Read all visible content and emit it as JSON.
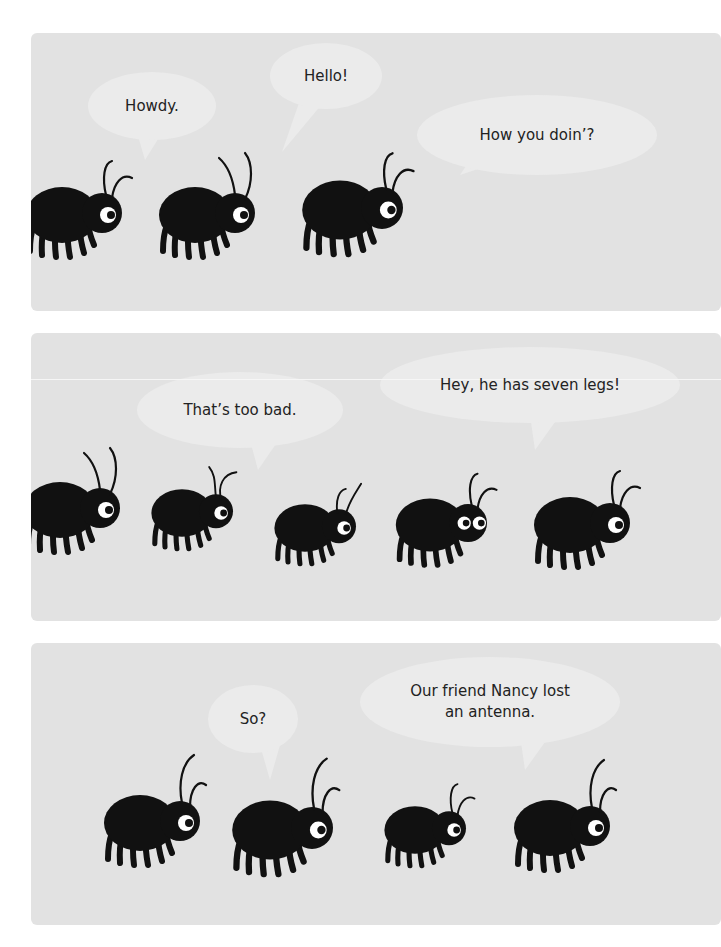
{
  "comic": {
    "colors": {
      "panel": "#e2e2e2",
      "bubble": "#ebebeb",
      "bug": "#111111",
      "eye": "#ffffff",
      "text": "#222222",
      "page": "#ffffff"
    },
    "panels": [
      {
        "id": "panel-1",
        "top": 33,
        "height": 278,
        "bubbles": [
          {
            "text": "Howdy.",
            "cx": 152,
            "cy": 106,
            "rx": 64,
            "ry": 34,
            "tail": [
              [
                138,
                136
              ],
              [
                160,
                136
              ],
              [
                145,
                160
              ]
            ]
          },
          {
            "text": "Hello!",
            "cx": 326,
            "cy": 76,
            "rx": 56,
            "ry": 33,
            "tail": [
              [
                300,
                100
              ],
              [
                322,
                104
              ],
              [
                282,
                152
              ]
            ]
          },
          {
            "text": "How you doin’?",
            "cx": 537,
            "cy": 135,
            "rx": 120,
            "ry": 40,
            "tail": [
              [
                470,
                160
              ],
              [
                490,
                165
              ],
              [
                460,
                175
              ]
            ]
          }
        ],
        "bugs": [
          {
            "x": 62,
            "y": 215,
            "scale": 1.0,
            "eyes": 1,
            "antennae": "curl"
          },
          {
            "x": 195,
            "y": 215,
            "scale": 1.0,
            "eyes": 1,
            "antennae": "tall"
          },
          {
            "x": 340,
            "y": 210,
            "scale": 1.05,
            "eyes": 1,
            "antennae": "curl"
          }
        ]
      },
      {
        "id": "panel-2",
        "top": 333,
        "height": 288,
        "crease_y": 46,
        "bubbles": [
          {
            "text": "That’s too bad.",
            "cx": 240,
            "cy": 410,
            "rx": 103,
            "ry": 38,
            "tail": [
              [
                250,
                440
              ],
              [
                280,
                438
              ],
              [
                258,
                470
              ]
            ]
          },
          {
            "text": "Hey, he has seven legs!",
            "cx": 530,
            "cy": 385,
            "rx": 150,
            "ry": 38,
            "tail": [
              [
                530,
                415
              ],
              [
                560,
                415
              ],
              [
                535,
                450
              ]
            ]
          }
        ],
        "bugs": [
          {
            "x": 60,
            "y": 510,
            "scale": 1.0,
            "eyes": 1,
            "antennae": "tall"
          },
          {
            "x": 182,
            "y": 513,
            "scale": 0.85,
            "eyes": 1,
            "antennae": "cross"
          },
          {
            "x": 305,
            "y": 528,
            "scale": 0.85,
            "eyes": 1,
            "antennae": "oneup"
          },
          {
            "x": 430,
            "y": 525,
            "scale": 0.95,
            "eyes": 2,
            "antennae": "curl"
          },
          {
            "x": 570,
            "y": 525,
            "scale": 1.0,
            "eyes": 1,
            "antennae": "curl"
          }
        ]
      },
      {
        "id": "panel-3",
        "top": 643,
        "height": 282,
        "bubbles": [
          {
            "text": "So?",
            "cx": 253,
            "cy": 719,
            "rx": 45,
            "ry": 34,
            "tail": [
              [
                260,
                745
              ],
              [
                280,
                745
              ],
              [
                270,
                780
              ]
            ]
          },
          {
            "text": "Our friend Nancy lost\nan antenna.",
            "cx": 490,
            "cy": 702,
            "rx": 130,
            "ry": 45,
            "tail": [
              [
                520,
                735
              ],
              [
                550,
                735
              ],
              [
                525,
                770
              ]
            ]
          }
        ],
        "bugs": [
          {
            "x": 140,
            "y": 823,
            "scale": 1.0,
            "eyes": 1,
            "antennae": "tallcurl"
          },
          {
            "x": 270,
            "y": 830,
            "scale": 1.05,
            "eyes": 1,
            "antennae": "tallcurl"
          },
          {
            "x": 415,
            "y": 830,
            "scale": 0.85,
            "eyes": 1,
            "antennae": "curl"
          },
          {
            "x": 550,
            "y": 828,
            "scale": 1.0,
            "eyes": 1,
            "antennae": "tallcurl"
          }
        ]
      }
    ]
  }
}
